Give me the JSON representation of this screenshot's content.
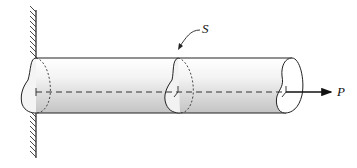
{
  "diagram": {
    "type": "mechanics-bar-axial-load",
    "labels": {
      "section": "S",
      "load": "P"
    },
    "colors": {
      "stroke": "#222222",
      "shade_light": "#ffffff",
      "shade_dark": "#bdbdbd"
    }
  }
}
